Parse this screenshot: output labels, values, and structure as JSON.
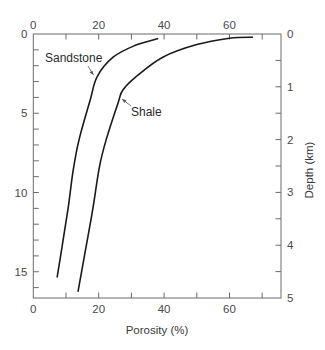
{
  "chart_data": {
    "type": "line",
    "title": "",
    "xlabel": "Porosity (%)",
    "ylabel_right": "Depth (km)",
    "ylabel_left": "",
    "xlim": [
      0,
      76
    ],
    "x_ticks_labeled": [
      0,
      20,
      40,
      60
    ],
    "x_tick_step": 10,
    "y_right_lim": [
      0,
      5
    ],
    "y_right_ticks_labeled": [
      0,
      1,
      2,
      3,
      4,
      5
    ],
    "y_right_tick_step": 0.5,
    "y_left_lim": [
      0,
      16.7
    ],
    "y_left_ticks_labeled": [
      0,
      5,
      10,
      15
    ],
    "y_left_tick_step": 1,
    "y_inverted": true,
    "grid": false,
    "legend": "none (inline annotations)",
    "series": [
      {
        "name": "Sandstone",
        "points": [
          {
            "porosity": 38.0,
            "depth_km": 0.09
          },
          {
            "porosity": 31.0,
            "depth_km": 0.22
          },
          {
            "porosity": 24.4,
            "depth_km": 0.44
          },
          {
            "porosity": 19.5,
            "depth_km": 0.81
          },
          {
            "porosity": 17.4,
            "depth_km": 1.25
          },
          {
            "porosity": 14.0,
            "depth_km": 2.0
          },
          {
            "porosity": 12.2,
            "depth_km": 2.58
          },
          {
            "porosity": 10.7,
            "depth_km": 3.28
          },
          {
            "porosity": 9.0,
            "depth_km": 3.95
          },
          {
            "porosity": 7.3,
            "depth_km": 4.6
          }
        ]
      },
      {
        "name": "Shale",
        "points": [
          {
            "porosity": 67.0,
            "depth_km": 0.06
          },
          {
            "porosity": 60.0,
            "depth_km": 0.08
          },
          {
            "porosity": 50.0,
            "depth_km": 0.2
          },
          {
            "porosity": 39.6,
            "depth_km": 0.44
          },
          {
            "porosity": 32.0,
            "depth_km": 0.78
          },
          {
            "porosity": 27.4,
            "depth_km": 1.06
          },
          {
            "porosity": 25.9,
            "depth_km": 1.31
          },
          {
            "porosity": 22.3,
            "depth_km": 2.0
          },
          {
            "porosity": 20.2,
            "depth_km": 2.52
          },
          {
            "porosity": 18.3,
            "depth_km": 3.28
          },
          {
            "porosity": 16.0,
            "depth_km": 4.08
          },
          {
            "porosity": 13.7,
            "depth_km": 4.87
          }
        ]
      }
    ],
    "annotations": [
      {
        "text": "Sandstone",
        "arrow_to": {
          "porosity": 18.6,
          "depth_km": 0.78
        }
      },
      {
        "text": "Shale",
        "arrow_to": {
          "porosity": 26.8,
          "depth_km": 1.23
        }
      }
    ]
  },
  "labels": {
    "x_axis_title": "Porosity (%)",
    "y_axis_title": "Depth (km)",
    "sandstone": "Sandstone",
    "shale": "Shale"
  }
}
